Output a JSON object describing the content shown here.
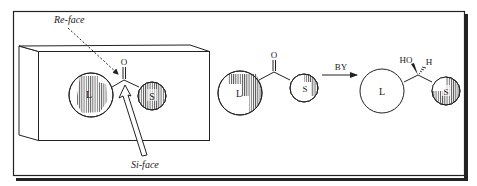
{
  "figure": {
    "left_panel": {
      "carbonyl_atom": "O",
      "large_group": "L",
      "small_group": "S",
      "re_face_label": "Re-face",
      "si_face_label": "Si-face"
    },
    "substrate": {
      "carbonyl_atom": "O",
      "large_group": "L",
      "small_group": "S"
    },
    "reaction": {
      "reagent": "BY"
    },
    "product": {
      "hydroxyl": "HO",
      "hydrogen": "H",
      "large_group": "L",
      "small_group": "S"
    }
  },
  "colors": {
    "ink": "#222222",
    "background": "#ffffff"
  }
}
